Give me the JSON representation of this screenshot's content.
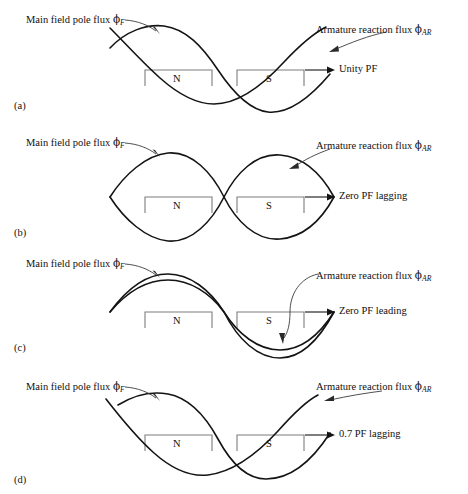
{
  "figure": {
    "line_color": "#141414",
    "bracket_color": "#7d7d7d",
    "leader_color": "#3b3b3b",
    "background": "#ffffff"
  },
  "labels": {
    "main_flux": "Main field pole flux",
    "armature_flux": "Armature reaction flux",
    "phi": "ϕ",
    "sub_field": "F",
    "sub_armature": "AR",
    "pole_north": "N",
    "pole_south": "S"
  },
  "panels": [
    {
      "tag": "(a)",
      "pf_label": "Unity PF",
      "condition": "unity",
      "phase_shift_deg": 90,
      "main_amplitude": 1.0,
      "armature_amplitude": 1.0
    },
    {
      "tag": "(b)",
      "pf_label": "Zero PF lagging",
      "condition": "zero-lagging",
      "phase_shift_deg": 180,
      "main_amplitude": 1.0,
      "armature_amplitude": 1.0
    },
    {
      "tag": "(c)",
      "pf_label": "Zero PF leading",
      "condition": "zero-leading",
      "phase_shift_deg": 0,
      "main_amplitude": 1.0,
      "armature_amplitude": 0.86
    },
    {
      "tag": "(d)",
      "pf_label": "0.7 PF lagging",
      "condition": "0.7-lagging",
      "phase_shift_deg": 135,
      "main_amplitude": 1.0,
      "armature_amplitude": 1.0
    }
  ]
}
